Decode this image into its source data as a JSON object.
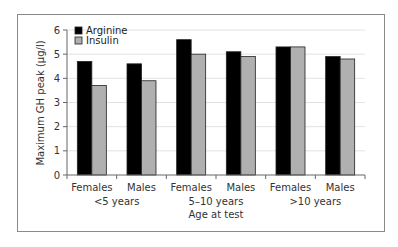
{
  "chart_data": {
    "type": "bar",
    "title": "",
    "xlabel": "Age at test",
    "ylabel": "Maximum GH peak (µg/l)",
    "ylim": [
      0,
      6
    ],
    "yticks": [
      0,
      1,
      2,
      3,
      4,
      5,
      6
    ],
    "grid": true,
    "legend_position": "top-left inside",
    "categories": [
      "Females",
      "Males",
      "Females",
      "Males",
      "Females",
      "Males"
    ],
    "category_groups": [
      {
        "label": "<5 years",
        "span": [
          0,
          1
        ]
      },
      {
        "label": "5–10 years",
        "span": [
          2,
          3
        ]
      },
      {
        "label": ">10 years",
        "span": [
          4,
          5
        ]
      }
    ],
    "series": [
      {
        "name": "Arginine",
        "color": "#000000",
        "values": [
          4.7,
          4.6,
          5.6,
          5.1,
          5.3,
          4.9
        ]
      },
      {
        "name": "Insulin",
        "color": "#b0b0b0",
        "values": [
          3.7,
          3.9,
          5.0,
          4.9,
          5.3,
          4.8
        ]
      }
    ]
  },
  "legend": {
    "items": [
      {
        "label": "Arginine",
        "color": "#000000"
      },
      {
        "label": "Insulin",
        "color": "#b0b0b0"
      }
    ]
  },
  "axis": {
    "ylabel": "Maximum GH peak (µg/l)",
    "xlabel": "Age at test",
    "yticks": [
      "0",
      "1",
      "2",
      "3",
      "4",
      "5",
      "6"
    ],
    "categories": [
      "Females",
      "Males",
      "Females",
      "Males",
      "Females",
      "Males"
    ],
    "groups": [
      "<5 years",
      "5–10 years",
      ">10 years"
    ]
  }
}
